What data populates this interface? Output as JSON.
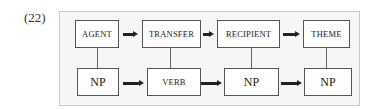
{
  "example_number": "(22)",
  "diagram": {
    "top_row": [
      {
        "label": "AGENT"
      },
      {
        "label": "TRANSFER"
      },
      {
        "label": "RECIPIENT"
      },
      {
        "label": "THEME"
      }
    ],
    "bottom_row": [
      {
        "label": "NP"
      },
      {
        "label": "VERB"
      },
      {
        "label": "NP"
      },
      {
        "label": "NP"
      }
    ],
    "colors": {
      "frame_background": "#f6f6f4",
      "frame_border": "#c9c9c6",
      "box_border": "#555555",
      "arrow": "#222222"
    }
  }
}
